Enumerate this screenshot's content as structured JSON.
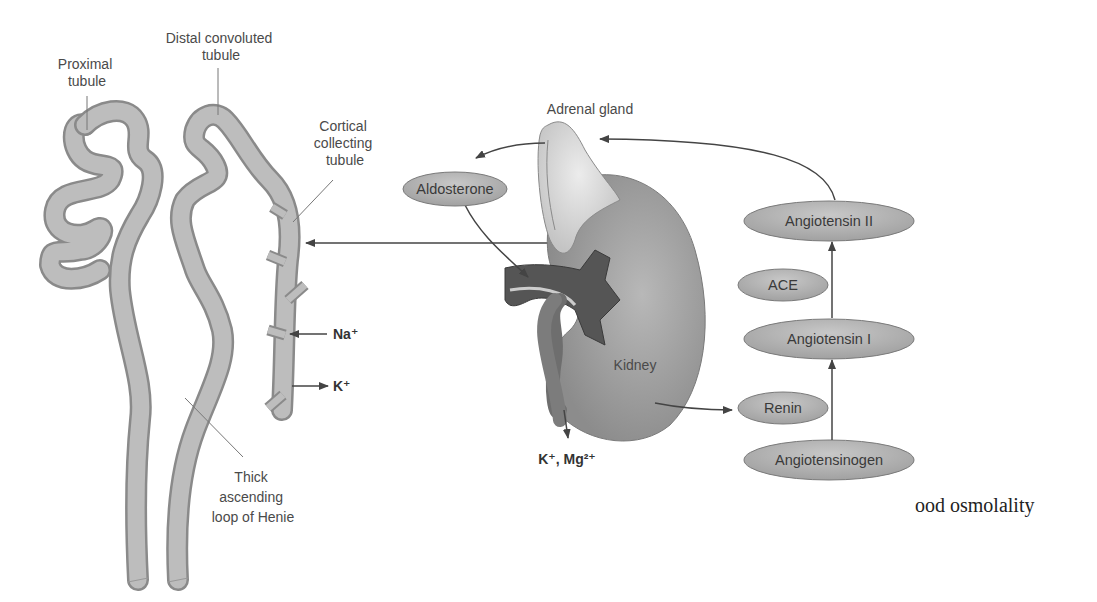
{
  "diagram": {
    "colors": {
      "tubule_fill": "#bdbdbd",
      "tubule_stroke": "#8a8a8a",
      "kidney_fill": "#9a9a9a",
      "kidney_dark": "#555555",
      "adrenal_fill": "#d9d9d9",
      "node_fill": "#b4b4b4",
      "node_stroke": "#7a7a7a",
      "arrow": "#444444",
      "label": "#4a4a4a"
    },
    "labels": {
      "proximal_tubule": [
        "Proximal",
        "tubule"
      ],
      "distal_convoluted_tubule": [
        "Distal convoluted",
        "tubule"
      ],
      "cortical_collecting_tubule": [
        "Cortical",
        "collecting",
        "tubule"
      ],
      "thick_ascending_loop": [
        "Thick",
        "ascending",
        "loop of Henie"
      ],
      "adrenal_gland": "Adrenal gland",
      "kidney": "Kidney",
      "na_ion": "Na⁺",
      "k_ion": "K⁺",
      "k_mg_ions": "K⁺, Mg²⁺",
      "cut_off_text": "ood osmolality"
    },
    "nodes": {
      "aldosterone": "Aldosterone",
      "angiotensin_ii": "Angiotensin II",
      "ace": "ACE",
      "angiotensin_i": "Angiotensin I",
      "renin": "Renin",
      "angiotensinogen": "Angiotensinogen"
    }
  }
}
